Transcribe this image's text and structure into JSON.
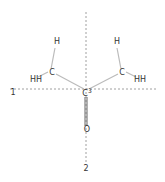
{
  "diagram": {
    "type": "molecular-structure-with-axes",
    "colors": {
      "axis": "#888888",
      "bond": "#bbbbbb",
      "double_bond": "#555555",
      "label": "#333333",
      "background": "#ffffff"
    },
    "axes": [
      {
        "id": "axis-1",
        "label": "1",
        "orientation": "horizontal",
        "x1": 10,
        "y1": 89,
        "x2": 158,
        "y2": 89,
        "label_x": 13,
        "label_y": 93
      },
      {
        "id": "axis-2",
        "label": "2",
        "orientation": "vertical",
        "x1": 86,
        "y1": 12,
        "x2": 86,
        "y2": 163,
        "label_x": 86,
        "label_y": 169
      }
    ],
    "atoms": [
      {
        "id": "c3",
        "symbol": "C",
        "superscript": "3",
        "x": 87,
        "y": 94
      },
      {
        "id": "o",
        "symbol": "O",
        "superscript": "",
        "x": 87,
        "y": 130
      },
      {
        "id": "c-left",
        "symbol": "C",
        "superscript": "",
        "x": 52,
        "y": 73
      },
      {
        "id": "h-left-top",
        "symbol": "H",
        "superscript": "",
        "x": 57,
        "y": 42
      },
      {
        "id": "hh-left",
        "symbol": "HH",
        "superscript": "",
        "x": 36,
        "y": 80
      },
      {
        "id": "c-right",
        "symbol": "C",
        "superscript": "",
        "x": 122,
        "y": 73
      },
      {
        "id": "h-right-top",
        "symbol": "H",
        "superscript": "",
        "x": 117,
        "y": 42
      },
      {
        "id": "hh-right",
        "symbol": "HH",
        "superscript": "",
        "x": 140,
        "y": 80
      }
    ],
    "bonds": [
      {
        "from": "c3",
        "to": "o",
        "x1": 86,
        "y1": 97,
        "x2": 86,
        "y2": 126,
        "order": 2
      },
      {
        "from": "c3",
        "to": "c-left",
        "x1": 84,
        "y1": 89,
        "x2": 56,
        "y2": 74,
        "order": 1
      },
      {
        "from": "c3",
        "to": "c-right",
        "x1": 89,
        "y1": 89,
        "x2": 118,
        "y2": 74,
        "order": 1
      },
      {
        "from": "c-left",
        "to": "h-left-top",
        "x1": 51,
        "y1": 69,
        "x2": 55,
        "y2": 48,
        "order": 1
      },
      {
        "from": "c-left",
        "to": "hh-left",
        "x1": 48,
        "y1": 72,
        "x2": 38,
        "y2": 77,
        "order": 1
      },
      {
        "from": "c-right",
        "to": "h-right-top",
        "x1": 121,
        "y1": 69,
        "x2": 117,
        "y2": 48,
        "order": 1
      },
      {
        "from": "c-right",
        "to": "hh-right",
        "x1": 126,
        "y1": 72,
        "x2": 136,
        "y2": 77,
        "order": 1
      }
    ]
  }
}
